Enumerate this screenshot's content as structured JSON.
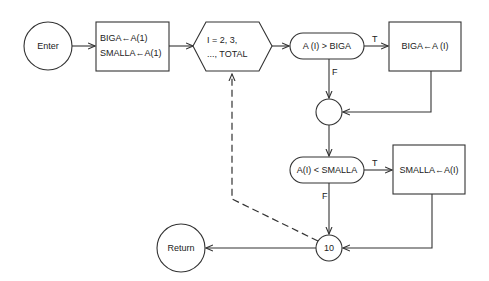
{
  "diagram": {
    "type": "flowchart",
    "nodes": {
      "enter": {
        "shape": "circle",
        "label": "Enter"
      },
      "init": {
        "shape": "rectangle",
        "lines": [
          "BIGA←A(1)",
          "SMALLA←A(1)"
        ]
      },
      "loop": {
        "shape": "hexagon",
        "lines": [
          "I = 2, 3,",
          "..., TOTAL"
        ]
      },
      "cond_big": {
        "shape": "rounded-decision",
        "label": "A (I) > BIGA"
      },
      "set_big": {
        "shape": "rectangle",
        "label": "BIGA←A (I)"
      },
      "join": {
        "shape": "circle",
        "label": ""
      },
      "cond_small": {
        "shape": "rounded-decision",
        "label": "A(I) < SMALLA"
      },
      "set_small": {
        "shape": "rectangle",
        "label": "SMALLA←A(I)"
      },
      "connector_10": {
        "shape": "circle",
        "label": "10"
      },
      "return": {
        "shape": "circle",
        "label": "Return"
      }
    },
    "edge_labels": {
      "cond_big_true": "T",
      "cond_big_false": "F",
      "cond_small_true": "T",
      "cond_small_false": "F"
    },
    "edges": [
      {
        "from": "enter",
        "to": "init"
      },
      {
        "from": "init",
        "to": "loop"
      },
      {
        "from": "loop",
        "to": "cond_big"
      },
      {
        "from": "cond_big",
        "to": "set_big",
        "label": "T"
      },
      {
        "from": "cond_big",
        "to": "join",
        "label": "F"
      },
      {
        "from": "set_big",
        "to": "join"
      },
      {
        "from": "join",
        "to": "cond_small"
      },
      {
        "from": "cond_small",
        "to": "set_small",
        "label": "T"
      },
      {
        "from": "cond_small",
        "to": "connector_10",
        "label": "F"
      },
      {
        "from": "set_small",
        "to": "connector_10"
      },
      {
        "from": "connector_10",
        "to": "return"
      },
      {
        "from": "connector_10",
        "to": "loop",
        "style": "dashed"
      }
    ],
    "colors": {
      "stroke": "#333333",
      "text": "#222222",
      "background": "#ffffff"
    }
  }
}
